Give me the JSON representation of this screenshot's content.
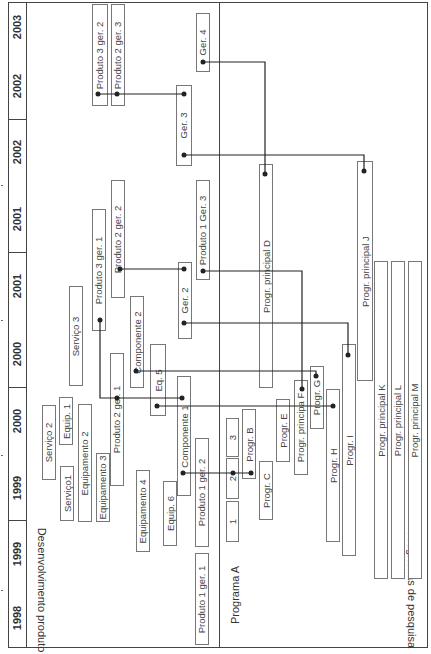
{
  "timeline": {
    "years": [
      "1998",
      "1999",
      "1999",
      "2000",
      "2000",
      "2001",
      "2001",
      "2002",
      "2002",
      "2003"
    ]
  },
  "sections": {
    "product_dev": "Desenvolvimento produto",
    "research": "Programas de pesquisa"
  },
  "product_boxes": {
    "servico2": "Serviço 2",
    "servico1": "Serviço1",
    "equip1": "Equip. 1",
    "equipamento2": "Equipamento 2",
    "equipamento3": "Equipamento 3",
    "equipamento4": "Equipamento 4",
    "equip6": "Equip. 6",
    "servico3": "Serviço 3",
    "produto3ger1": "Produto 3 ger. 1",
    "produto2ger1": "Produto 2 ger. 1",
    "produto2ger2": "Produto 2 ger. 2",
    "componente2": "Componente 2",
    "eq5": "Eq. 5",
    "componente1": "Componente 1",
    "produto1ger1": "Produto 1 ger. 1",
    "produto1ger2": "Produto 1 ger. 2",
    "ger2": "Ger. 2",
    "produto1ger3": "Produto 1 Ger. 3",
    "ger3": "Ger. 3",
    "produto3ger2": "Produto 3 ger. 2",
    "produto2ger3": "Produto 2 ger. 3",
    "ger4": "Ger. 4"
  },
  "research_boxes": {
    "programaA": "Programa A",
    "p1": "1",
    "p2": "2",
    "p3": "3",
    "progrB": "Progr. B",
    "progrC": "Progr. C",
    "progrE": "Progr. E",
    "progrF": "Progr. principa F",
    "progrG": "Progr. G",
    "progrH": "Progr. H",
    "progrI": "Progr. I",
    "progrD": "Progr. principal  D",
    "progrJ": "Progr. principal J",
    "progrK": "Progr. principal K",
    "progrL": "Progr. principal L",
    "progrM": "Progr. principal M"
  }
}
